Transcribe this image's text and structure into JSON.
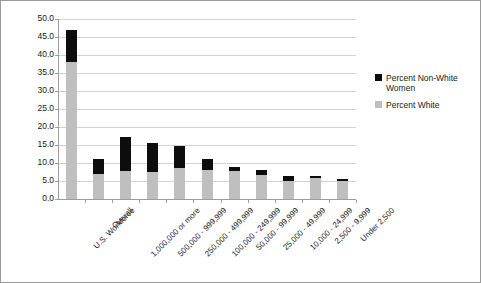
{
  "chart_data": {
    "type": "bar",
    "subtype": "stacked-bar",
    "title": "",
    "xlabel": "",
    "ylabel": "",
    "ylim": [
      0,
      50
    ],
    "ytick_step": 5,
    "ytick_labels": [
      "50.0",
      "45.0",
      "40.0",
      "35.0",
      "30.0",
      "25.0",
      "20.0",
      "15.0",
      "10.0",
      "5.0",
      "0.0"
    ],
    "grid": true,
    "legend_position": "right",
    "categories": [
      "U.S. Workforce",
      "Overall",
      "1,000,000 or more",
      "500,000 - 999,999",
      "250,000 - 499,999",
      "100,000 - 249,999",
      "50,000 - 99,999",
      "25,000 - 49,999",
      "10,000 - 24,999",
      "2,500 - 9,999",
      "Under 2,500"
    ],
    "series": [
      {
        "name": "Percent White",
        "color": "#bfbfbf",
        "values": [
          38.0,
          6.9,
          7.9,
          7.6,
          8.6,
          8.1,
          7.7,
          6.7,
          4.9,
          5.7,
          5.0
        ]
      },
      {
        "name": "Percent Non-White Women",
        "color": "#0d0d0d",
        "values": [
          9.0,
          4.3,
          9.2,
          8.0,
          6.0,
          2.9,
          1.1,
          1.3,
          1.6,
          0.6,
          0.6
        ]
      }
    ],
    "totals": [
      47.0,
      11.2,
      17.1,
      15.6,
      14.6,
      11.0,
      8.8,
      8.0,
      6.5,
      6.3,
      5.6
    ]
  },
  "legend": {
    "items": [
      {
        "label": "Percent Non-White Women",
        "color": "#0d0d0d"
      },
      {
        "label": "Percent White",
        "color": "#bfbfbf"
      }
    ]
  }
}
